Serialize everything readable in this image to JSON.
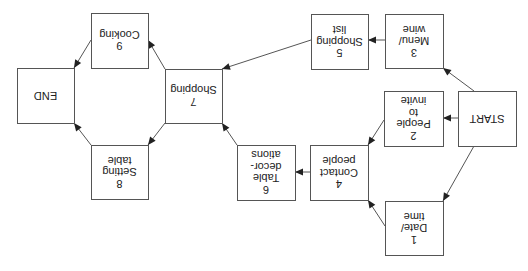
{
  "diagram": {
    "type": "flowchart",
    "orientation": "rotated-180",
    "colors": {
      "stroke": "#555555",
      "text": "#222222",
      "background": "#ffffff"
    },
    "nodes": [
      {
        "id": "start",
        "lines": [
          "START"
        ],
        "x": 458,
        "y": 91,
        "w": 58,
        "h": 55
      },
      {
        "id": "n1",
        "lines": [
          "1",
          "Date/",
          "time"
        ],
        "x": 385,
        "y": 201,
        "w": 58,
        "h": 54
      },
      {
        "id": "n2",
        "lines": [
          "2",
          "People",
          "to",
          "invite"
        ],
        "x": 384,
        "y": 91,
        "w": 59,
        "h": 55
      },
      {
        "id": "n3",
        "lines": [
          "3",
          "Menu/",
          "wine"
        ],
        "x": 385,
        "y": 14,
        "w": 58,
        "h": 54
      },
      {
        "id": "n4",
        "lines": [
          "4",
          "Contact",
          "people"
        ],
        "x": 310,
        "y": 145,
        "w": 58,
        "h": 55
      },
      {
        "id": "n5",
        "lines": [
          "5",
          "Shopping",
          "list"
        ],
        "x": 311,
        "y": 14,
        "w": 57,
        "h": 55
      },
      {
        "id": "n6",
        "lines": [
          "6",
          "Table",
          "decor-",
          "ations"
        ],
        "x": 237,
        "y": 145,
        "w": 58,
        "h": 55
      },
      {
        "id": "n7",
        "lines": [
          "7",
          "Shopping"
        ],
        "x": 165,
        "y": 69,
        "w": 57,
        "h": 54
      },
      {
        "id": "n8",
        "lines": [
          "8",
          "Setting",
          "table"
        ],
        "x": 91,
        "y": 145,
        "w": 57,
        "h": 54
      },
      {
        "id": "n9",
        "lines": [
          "9",
          "Cooking"
        ],
        "x": 91,
        "y": 13,
        "w": 57,
        "h": 55
      },
      {
        "id": "end",
        "lines": [
          "END"
        ],
        "x": 17,
        "y": 68,
        "w": 57,
        "h": 55
      }
    ],
    "edges": [
      {
        "from": "start",
        "to": "n1",
        "x1": 474,
        "y1": 146,
        "x2": 443,
        "y2": 201
      },
      {
        "from": "start",
        "to": "n2",
        "x1": 458,
        "y1": 118,
        "x2": 443,
        "y2": 118
      },
      {
        "from": "start",
        "to": "n3",
        "x1": 474,
        "y1": 91,
        "x2": 443,
        "y2": 68
      },
      {
        "from": "n1",
        "to": "n4",
        "x1": 385,
        "y1": 226,
        "x2": 368,
        "y2": 200
      },
      {
        "from": "n2",
        "to": "n4",
        "x1": 384,
        "y1": 120,
        "x2": 368,
        "y2": 145
      },
      {
        "from": "n3",
        "to": "n5",
        "x1": 385,
        "y1": 40,
        "x2": 368,
        "y2": 40
      },
      {
        "from": "n4",
        "to": "n6",
        "x1": 310,
        "y1": 172,
        "x2": 295,
        "y2": 172
      },
      {
        "from": "n5",
        "to": "n7",
        "x1": 311,
        "y1": 40,
        "x2": 222,
        "y2": 69
      },
      {
        "from": "n6",
        "to": "n7",
        "x1": 237,
        "y1": 145,
        "x2": 222,
        "y2": 123
      },
      {
        "from": "n7",
        "to": "n8",
        "x1": 165,
        "y1": 123,
        "x2": 148,
        "y2": 145
      },
      {
        "from": "n7",
        "to": "n9",
        "x1": 165,
        "y1": 69,
        "x2": 148,
        "y2": 40
      },
      {
        "from": "n8",
        "to": "end",
        "x1": 91,
        "y1": 145,
        "x2": 74,
        "y2": 123
      },
      {
        "from": "n9",
        "to": "end",
        "x1": 91,
        "y1": 40,
        "x2": 74,
        "y2": 68
      }
    ]
  }
}
